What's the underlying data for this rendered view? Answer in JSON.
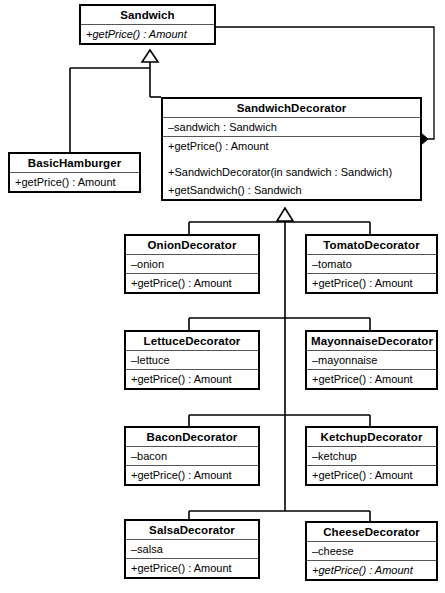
{
  "diagram": {
    "type": "uml-class-diagram",
    "background_color": "#ffffff",
    "line_color": "#000000"
  },
  "classes": {
    "sandwich": {
      "name": "Sandwich",
      "methods": [
        "+getPrice() : Amount"
      ]
    },
    "basic_hamburger": {
      "name": "BasicHamburger",
      "methods": [
        "+getPrice() : Amount"
      ]
    },
    "sandwich_decorator": {
      "name": "SandwichDecorator",
      "attributes": [
        "–sandwich : Sandwich"
      ],
      "methods": [
        "+getPrice() : Amount",
        "",
        "+SandwichDecorator(in sandwich : Sandwich)",
        "+getSandwich() : Sandwich"
      ]
    },
    "onion": {
      "name": "OnionDecorator",
      "attributes": [
        "–onion"
      ],
      "methods": [
        "+getPrice() : Amount"
      ]
    },
    "tomato": {
      "name": "TomatoDecorator",
      "attributes": [
        "–tomato"
      ],
      "methods": [
        "+getPrice() : Amount"
      ]
    },
    "lettuce": {
      "name": "LettuceDecorator",
      "attributes": [
        "–lettuce"
      ],
      "methods": [
        "+getPrice() : Amount"
      ]
    },
    "mayonnaise": {
      "name": "MayonnaiseDecorator",
      "attributes": [
        "–mayonnaise"
      ],
      "methods": [
        "+getPrice() : Amount"
      ]
    },
    "bacon": {
      "name": "BaconDecorator",
      "attributes": [
        "–bacon"
      ],
      "methods": [
        "+getPrice() : Amount"
      ]
    },
    "ketchup": {
      "name": "KetchupDecorator",
      "attributes": [
        "–ketchup"
      ],
      "methods": [
        "+getPrice() : Amount"
      ]
    },
    "salsa": {
      "name": "SalsaDecorator",
      "attributes": [
        "–salsa"
      ],
      "methods": [
        "+getPrice() : Amount"
      ]
    },
    "cheese": {
      "name": "CheeseDecorator",
      "attributes": [
        "–cheese"
      ],
      "methods": [
        "+getPrice() : Amount"
      ]
    }
  },
  "relationships": [
    {
      "kind": "generalization",
      "from": "BasicHamburger",
      "to": "Sandwich"
    },
    {
      "kind": "generalization",
      "from": "SandwichDecorator",
      "to": "Sandwich"
    },
    {
      "kind": "composition",
      "from": "SandwichDecorator",
      "to": "Sandwich"
    },
    {
      "kind": "generalization",
      "from": "OnionDecorator",
      "to": "SandwichDecorator"
    },
    {
      "kind": "generalization",
      "from": "TomatoDecorator",
      "to": "SandwichDecorator"
    },
    {
      "kind": "generalization",
      "from": "LettuceDecorator",
      "to": "SandwichDecorator"
    },
    {
      "kind": "generalization",
      "from": "MayonnaiseDecorator",
      "to": "SandwichDecorator"
    },
    {
      "kind": "generalization",
      "from": "BaconDecorator",
      "to": "SandwichDecorator"
    },
    {
      "kind": "generalization",
      "from": "KetchupDecorator",
      "to": "SandwichDecorator"
    },
    {
      "kind": "generalization",
      "from": "SalsaDecorator",
      "to": "SandwichDecorator"
    },
    {
      "kind": "generalization",
      "from": "CheeseDecorator",
      "to": "SandwichDecorator"
    }
  ]
}
